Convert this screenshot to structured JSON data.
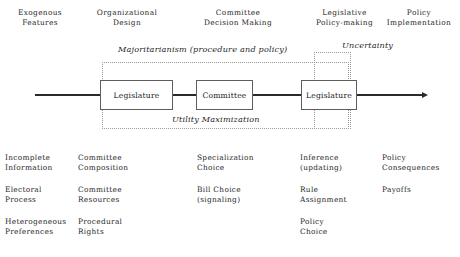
{
  "figure": {
    "stages": [
      {
        "id": "exogenous-features",
        "title": "Exogenous\nFeatures",
        "left": 0,
        "width": 80
      },
      {
        "id": "organizational-design",
        "title": "Organizational\nDesign",
        "left": 72,
        "width": 110
      },
      {
        "id": "committee-decision",
        "title": "Committee\nDecision Making",
        "left": 178,
        "width": 120
      },
      {
        "id": "legislative-policy",
        "title": "Legislative\nPolicy-making",
        "left": 292,
        "width": 105
      },
      {
        "id": "policy-implementation",
        "title": "Policy\nImplementation",
        "left": 378,
        "width": 82
      }
    ],
    "annotations": [
      {
        "id": "majoritarianism",
        "text": "Majoritarianism (procedure and policy)",
        "left": 118,
        "top": 44
      },
      {
        "id": "uncertainty",
        "text": "Uncertainty",
        "left": 342,
        "top": 40
      },
      {
        "id": "utility-maximization",
        "text": "Utility Maximization",
        "left": 172,
        "top": 114
      }
    ],
    "regions": [
      {
        "id": "majoritarianism-region",
        "left": 102,
        "top": 62,
        "width": 247,
        "height": 67
      },
      {
        "id": "uncertainty-region",
        "left": 314,
        "top": 52,
        "width": 37,
        "height": 77
      }
    ],
    "axis": {
      "left": 35,
      "top": 94,
      "width": 387,
      "label": "process-flow-arrow"
    },
    "nodes": [
      {
        "id": "legislature-1",
        "label": "Legislature",
        "left": 100,
        "top": 80,
        "width": 73,
        "height": 30
      },
      {
        "id": "committee",
        "label": "Committee",
        "left": 196,
        "top": 80,
        "width": 57,
        "height": 30
      },
      {
        "id": "legislature-2",
        "label": "Legislature",
        "left": 301,
        "top": 80,
        "width": 56,
        "height": 30
      }
    ],
    "attribute_columns": [
      {
        "id": "exogenous-features-attrs",
        "left": 5,
        "top": 153,
        "items": [
          "Incomplete\nInformation",
          "Electoral\nProcess",
          "Heterogeneous\nPreferences"
        ]
      },
      {
        "id": "organizational-design-attrs",
        "left": 78,
        "top": 153,
        "items": [
          "Committee\nComposition",
          "Committee\nResources",
          "Procedural\nRights"
        ]
      },
      {
        "id": "committee-decision-attrs",
        "left": 197,
        "top": 153,
        "items": [
          "Specialization\nChoice",
          "Bill Choice\n(signaling)"
        ]
      },
      {
        "id": "legislative-policy-attrs",
        "left": 300,
        "top": 153,
        "items": [
          "Inference\n(updating)",
          "Rule\nAssignment",
          "Policy\nChoice"
        ]
      },
      {
        "id": "policy-implementation-attrs",
        "left": 382,
        "top": 153,
        "items": [
          "Policy\nConsequences",
          "Payoffs"
        ]
      }
    ],
    "colors": {
      "ink": "#1f1f1f",
      "box_border": "#5d5d5d",
      "dotted_border": "#9a9a9a",
      "axis": "#2a2a2a",
      "background": "#ffffff"
    }
  }
}
